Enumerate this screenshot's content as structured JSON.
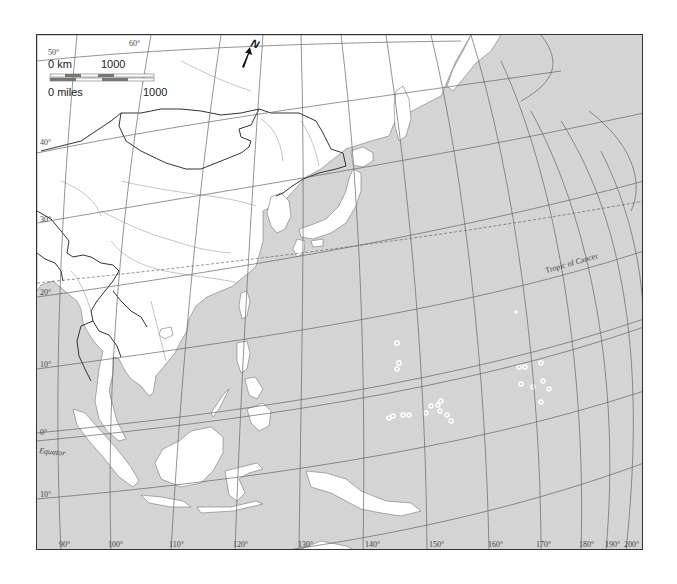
{
  "map": {
    "title": "",
    "ocean_color": "#d4d4d4",
    "land_color": "#ffffff",
    "border_color": "#333333",
    "graticule_color": "#555555",
    "river_color": "#999999"
  },
  "scale_bar": {
    "km_zero": "0 km",
    "km_max": "1000",
    "miles_zero": "0 miles",
    "miles_max": "1000"
  },
  "north_arrow": {
    "label": "N"
  },
  "latitude_labels": [
    {
      "text": "50°",
      "x": 47,
      "y": 54
    },
    {
      "text": "60°",
      "x": 131,
      "y": 44
    },
    {
      "text": "40°",
      "x": 41,
      "y": 144
    },
    {
      "text": "30°",
      "x": 41,
      "y": 221
    },
    {
      "text": "20°",
      "x": 41,
      "y": 294
    },
    {
      "text": "10°",
      "x": 41,
      "y": 366
    },
    {
      "text": "0°",
      "x": 41,
      "y": 433
    },
    {
      "text": "10°",
      "x": 41,
      "y": 496
    }
  ],
  "special_labels": {
    "equator": "Equator",
    "tropic_of_cancer": "Tropic of Cancer"
  },
  "longitude_labels": [
    {
      "text": "90°",
      "x": 58
    },
    {
      "text": "100°",
      "x": 106
    },
    {
      "text": "110°",
      "x": 168
    },
    {
      "text": "120°",
      "x": 232
    },
    {
      "text": "130°",
      "x": 297
    },
    {
      "text": "140°",
      "x": 364
    },
    {
      "text": "150°",
      "x": 428
    },
    {
      "text": "160°",
      "x": 487
    },
    {
      "text": "170°",
      "x": 535
    },
    {
      "text": "180°",
      "x": 578
    },
    {
      "text": "190°",
      "x": 604
    },
    {
      "text": "200°",
      "x": 623
    }
  ]
}
